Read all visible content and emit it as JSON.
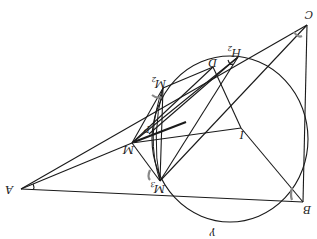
{
  "figure": {
    "orientation": "rotated-180",
    "labels": {
      "A": "A",
      "B": "B",
      "C": "C",
      "D": "D",
      "I": "I",
      "M": "M",
      "M2": "M",
      "M2_sub": "2",
      "M3": "M",
      "M3_sub": "3",
      "H2": "H",
      "H2_sub": "2",
      "P": "P",
      "gamma": "γ"
    },
    "points": {
      "A": [
        21,
        189
      ],
      "B": [
        303,
        202
      ],
      "C": [
        307,
        25
      ],
      "D": [
        213,
        67
      ],
      "I": [
        241,
        128
      ],
      "M": [
        132,
        143
      ],
      "M2": [
        163,
        88
      ],
      "M3": [
        160,
        181
      ],
      "H2": [
        238,
        57
      ],
      "P": [
        149,
        134
      ]
    },
    "circle_gamma": {
      "cx": 230,
      "cy": 139,
      "rx": 78,
      "ry": 83
    }
  }
}
